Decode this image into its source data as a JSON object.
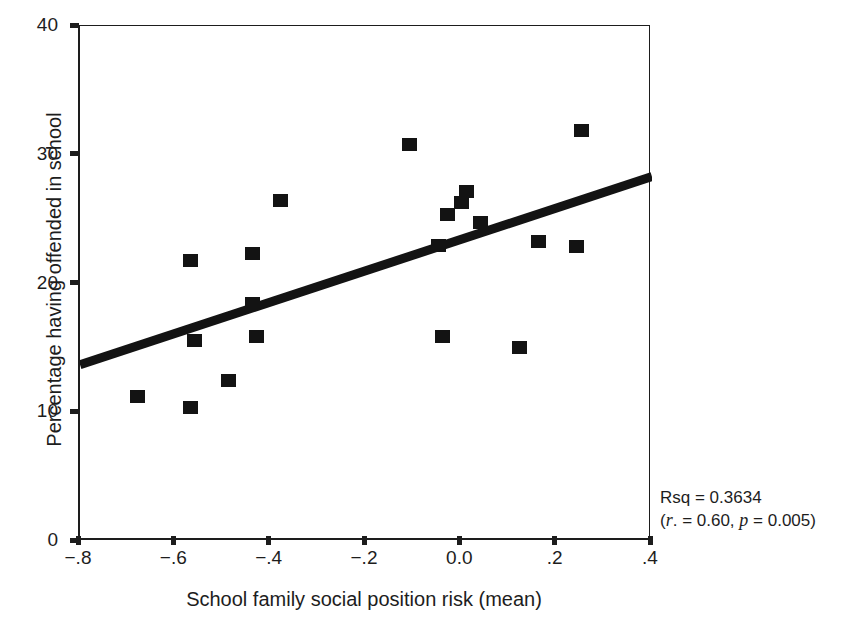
{
  "figure": {
    "top_artifact": "˙˙ ˙"
  },
  "annotation": {
    "line1": "Rsq = 0.3634",
    "line2_pre": "(",
    "line2_r": "r",
    "line2_mid": ". = 0.60, ",
    "line2_p": "p",
    "line2_post": " = 0.005)"
  },
  "chart_data": {
    "type": "scatter",
    "title": "",
    "xlabel": "School family social position risk (mean)",
    "ylabel": "Percentage having offended in school",
    "xlim": [
      -0.8,
      0.4
    ],
    "ylim": [
      0,
      40
    ],
    "xticks": [
      -0.8,
      -0.6,
      -0.4,
      -0.2,
      0.0,
      0.2,
      0.4
    ],
    "xticklabels": [
      "−.8",
      "−.6",
      "−.4",
      "−.2",
      "0.0",
      ".2",
      ".4"
    ],
    "yticks": [
      0,
      10,
      20,
      30,
      40
    ],
    "yticklabels": [
      "0",
      "10",
      "20",
      "30",
      "40"
    ],
    "grid": false,
    "legend": null,
    "marker": "square",
    "marker_color": "#131313",
    "points": [
      {
        "x": -0.68,
        "y": 11.3
      },
      {
        "x": -0.57,
        "y": 21.8
      },
      {
        "x": -0.57,
        "y": 10.4
      },
      {
        "x": -0.56,
        "y": 15.6
      },
      {
        "x": -0.49,
        "y": 12.5
      },
      {
        "x": -0.44,
        "y": 22.4
      },
      {
        "x": -0.44,
        "y": 18.5
      },
      {
        "x": -0.43,
        "y": 15.9
      },
      {
        "x": -0.38,
        "y": 26.5
      },
      {
        "x": -0.11,
        "y": 30.8
      },
      {
        "x": -0.05,
        "y": 23.0
      },
      {
        "x": -0.04,
        "y": 15.9
      },
      {
        "x": -0.03,
        "y": 25.4
      },
      {
        "x": 0.0,
        "y": 26.3
      },
      {
        "x": 0.01,
        "y": 27.2
      },
      {
        "x": 0.04,
        "y": 24.8
      },
      {
        "x": 0.12,
        "y": 15.1
      },
      {
        "x": 0.16,
        "y": 23.3
      },
      {
        "x": 0.24,
        "y": 22.9
      },
      {
        "x": 0.25,
        "y": 31.9
      }
    ],
    "fit_line": {
      "type": "linear",
      "x_start": -0.8,
      "y_start": 13.7,
      "x_end": 0.4,
      "y_end": 28.3,
      "color": "#131313",
      "width_px": 9
    },
    "stats": {
      "rsq": 0.3634,
      "r": 0.6,
      "p": 0.005
    }
  }
}
